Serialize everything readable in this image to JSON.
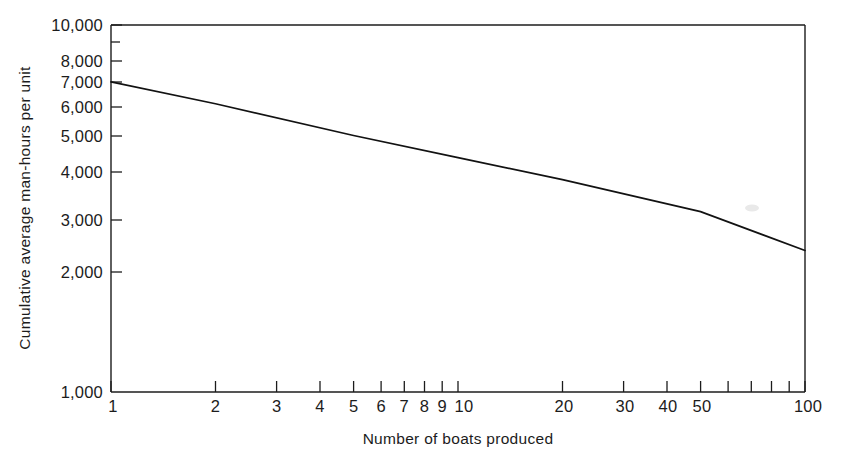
{
  "chart_data": {
    "type": "line",
    "title": "",
    "subtitle": "",
    "xlabel": "Number of boats produced",
    "ylabel": "Cumulative average man-hours per unit",
    "xscale": "log",
    "yscale": "log",
    "xlim": [
      1,
      100
    ],
    "ylim": [
      1000,
      10000
    ],
    "grid": false,
    "legend": null,
    "xticks": [
      1,
      2,
      3,
      4,
      5,
      6,
      7,
      8,
      9,
      10,
      20,
      30,
      40,
      50,
      100
    ],
    "xticklabels": [
      "1",
      "2",
      "3",
      "4",
      "5",
      "6",
      "7",
      "8",
      "9",
      "10",
      "20",
      "30",
      "40",
      "50",
      "100"
    ],
    "yticks": [
      1000,
      2000,
      3000,
      4000,
      5000,
      6000,
      7000,
      8000,
      10000
    ],
    "yticklabels": [
      "1,000",
      "2,000",
      "3,000",
      "4,000",
      "5,000",
      "6,000",
      "7,000",
      "8,000",
      "10,000"
    ],
    "series": [
      {
        "name": "Cumulative average man-hours",
        "x": [
          1,
          100
        ],
        "values": [
          7000,
          2430
        ],
        "points": [
          {
            "x": 1,
            "y": 7000
          },
          {
            "x": 2,
            "y": 6100
          },
          {
            "x": 5,
            "y": 5000
          },
          {
            "x": 10,
            "y": 4350
          },
          {
            "x": 20,
            "y": 3790
          },
          {
            "x": 50,
            "y": 3100
          },
          {
            "x": 100,
            "y": 2430
          }
        ]
      }
    ],
    "annotations": []
  },
  "axes": {
    "x_title": "Number of boats produced",
    "y_title": "Cumulative average man-hours per unit"
  },
  "tick_text": {
    "y": {
      "t10000": "10,000",
      "t8000": "8,000",
      "t7000": "7,000",
      "t6000": "6,000",
      "t5000": "5,000",
      "t4000": "4,000",
      "t3000": "3,000",
      "t2000": "2,000",
      "t1000": "1,000"
    },
    "x": {
      "t1": "1",
      "t2": "2",
      "t3": "3",
      "t4": "4",
      "t5": "5",
      "t6": "6",
      "t7": "7",
      "t8": "8",
      "t9": "9",
      "t10": "10",
      "t20": "20",
      "t30": "30",
      "t40": "40",
      "t50": "50",
      "t100": "100"
    }
  },
  "colors": {
    "background": "#ffffff",
    "axis": "#1c1c1c",
    "line": "#121212",
    "text": "#1c1c1c"
  }
}
